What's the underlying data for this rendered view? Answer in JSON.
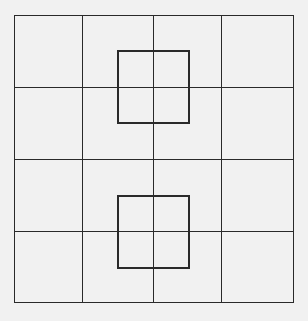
{
  "diagram": {
    "grid": {
      "rows": 4,
      "columns": 4
    },
    "overlay_squares": [
      {
        "name": "upper-square",
        "center_row_line": 1,
        "center_col_line": 2
      },
      {
        "name": "lower-square",
        "center_row_line": 3,
        "center_col_line": 2
      }
    ],
    "colors": {
      "background": "#f1f1f1",
      "line": "#2a2a2a"
    }
  }
}
